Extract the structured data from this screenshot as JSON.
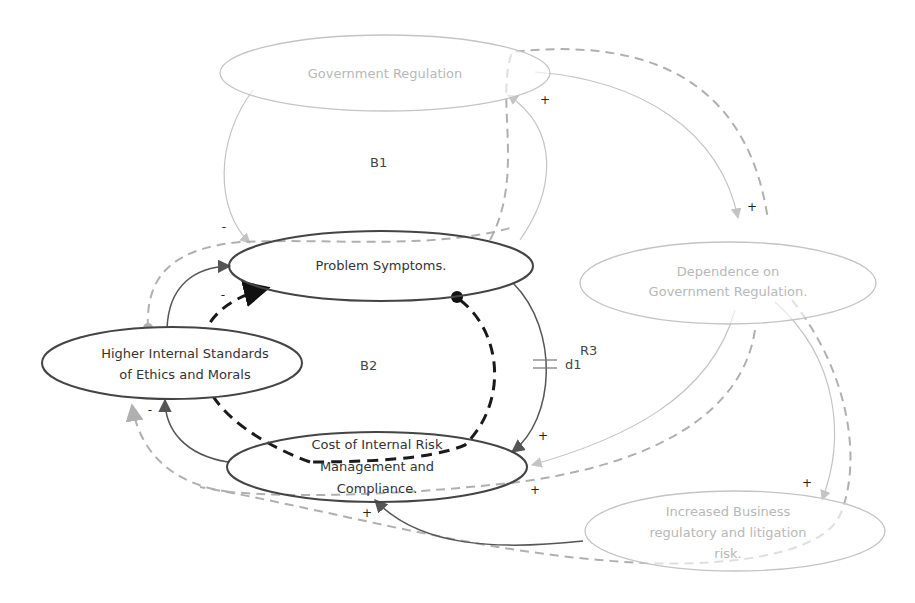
{
  "diagram": {
    "type": "causal-loop-diagram",
    "nodes": {
      "gov_reg": {
        "label": "Government Regulation",
        "style": "faded"
      },
      "problem": {
        "label": "Problem Symptoms.",
        "style": "dark"
      },
      "ethics": {
        "lines": [
          "Higher Internal Standards",
          "of Ethics and Morals"
        ],
        "style": "dark"
      },
      "cost": {
        "lines": [
          "Cost of Internal Risk",
          "Management and",
          "Compliance."
        ],
        "style": "dark"
      },
      "dependence": {
        "lines": [
          "Dependence on",
          "Government Regulation."
        ],
        "style": "faded"
      },
      "risk": {
        "lines": [
          "Increased Business",
          "regulatory and litigation",
          "risk."
        ],
        "style": "faded"
      }
    },
    "loops": {
      "b1": "B1",
      "b2": "B2",
      "r3": "R3"
    },
    "delay": {
      "label": "d1"
    },
    "polarities": {
      "gov_to_problem": "-",
      "ethics_to_problem": "-",
      "problem_to_gov": "+",
      "gov_to_dependence": "+",
      "problem_to_cost": "+",
      "cost_to_ethics": "-",
      "dependence_to_cost": "+",
      "risk_to_cost": "+",
      "dependence_to_risk": "+"
    },
    "colors": {
      "dark_stroke": "#555555",
      "faded_stroke": "#c4c4c4",
      "bold_dash": "#1a1a1a",
      "mid_dash": "#b0b0b0"
    }
  }
}
